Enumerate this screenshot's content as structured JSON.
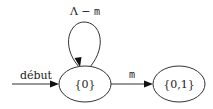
{
  "diagram": {
    "type": "finite-automaton",
    "states": [
      {
        "id": "s0",
        "label": "{0}",
        "initial": true
      },
      {
        "id": "s01",
        "label": "{0,1}",
        "initial": false
      }
    ],
    "start": {
      "label": "début",
      "target": "s0"
    },
    "transitions": [
      {
        "from": "s0",
        "to": "s0",
        "label_prefix": "Λ − ",
        "label_symbol": "m"
      },
      {
        "from": "s0",
        "to": "s01",
        "label_prefix": "",
        "label_symbol": "m"
      }
    ]
  }
}
